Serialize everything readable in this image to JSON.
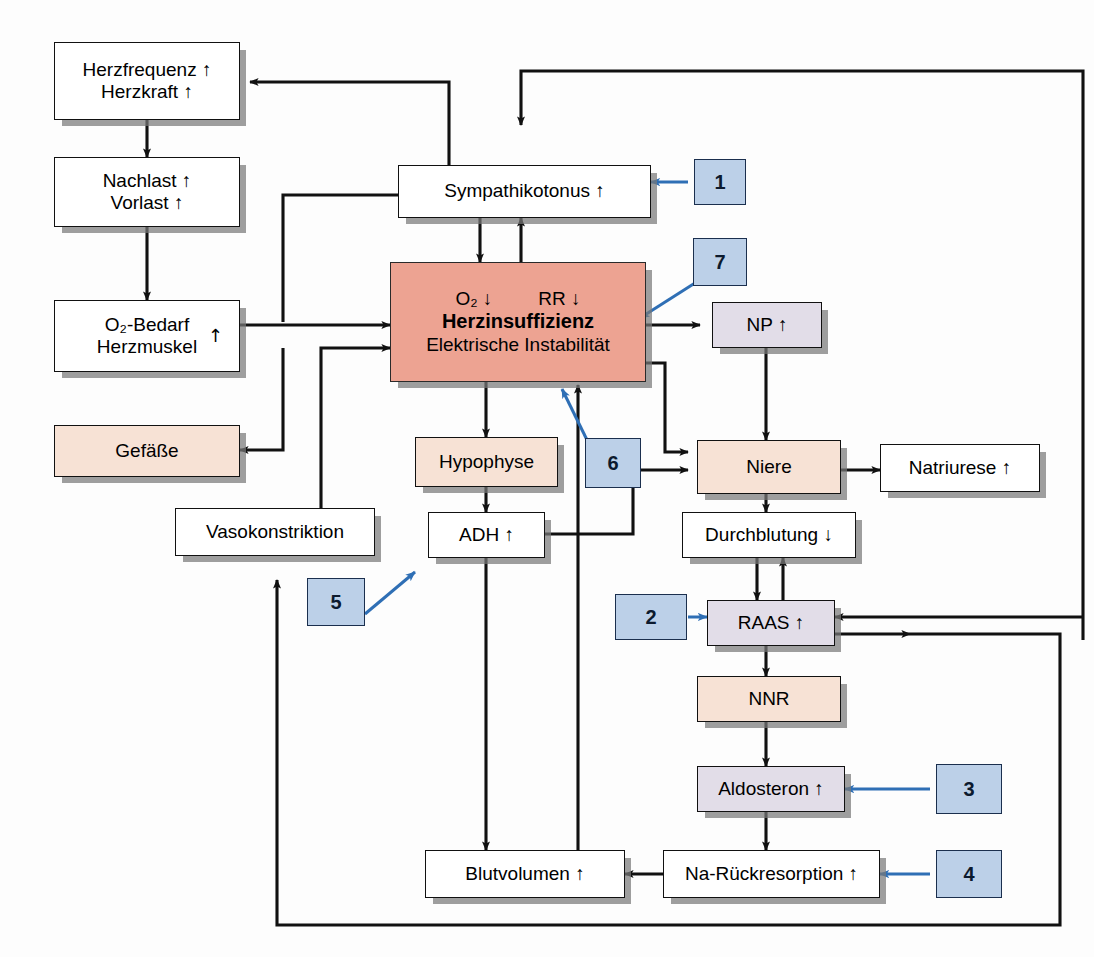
{
  "diagram": {
    "language": "de",
    "colors": {
      "center_fill": "#eda392",
      "peach_fill": "#f7e2d5",
      "lavender_fill": "#e2dde8",
      "white_fill": "#ffffff",
      "marker_fill": "#bcd0e8",
      "marker_border": "#1b2f4e",
      "marker_arrow": "#2f6fb5",
      "line": "#111111",
      "shadow": "#8b8b8b"
    },
    "glyphs": {
      "up": "↑",
      "down": "↓"
    }
  },
  "nodes": {
    "herzfrequenz": {
      "line1": "Herzfrequenz ↑",
      "line2": "Herzkraft ↑",
      "fill": "white"
    },
    "nachlast": {
      "line1": "Nachlast ↑",
      "line2": "Vorlast ↑",
      "fill": "white"
    },
    "o2bedarf": {
      "line1": "O₂-Bedarf",
      "line2": "Herzmuskel",
      "arrow": "↑",
      "fill": "white"
    },
    "gefaesse": {
      "line1": "Gefäße",
      "fill": "peach"
    },
    "vasokonstriktion": {
      "line1": "Vasokonstriktion",
      "fill": "white"
    },
    "sympathikotonus": {
      "line1": "Sympathikotonus ↑",
      "fill": "white"
    },
    "herzinsuffizienz": {
      "o2": "O₂ ↓",
      "rr": "RR ↓",
      "title": "Herzinsuffizienz",
      "subtitle": "Elektrische Instabilität",
      "fill": "center"
    },
    "hypophyse": {
      "line1": "Hypophyse",
      "fill": "peach"
    },
    "adh": {
      "line1": "ADH ↑",
      "fill": "white"
    },
    "blutvolumen": {
      "line1": "Blutvolumen ↑",
      "fill": "white"
    },
    "np": {
      "line1": "NP ↑",
      "fill": "lavender"
    },
    "niere": {
      "line1": "Niere",
      "fill": "peach"
    },
    "natriurese": {
      "line1": "Natriurese ↑",
      "fill": "white"
    },
    "durchblutung": {
      "line1": "Durchblutung ↓",
      "fill": "white"
    },
    "raas": {
      "line1": "RAAS ↑",
      "fill": "lavender"
    },
    "nnr": {
      "line1": "NNR",
      "fill": "peach"
    },
    "aldosteron": {
      "line1": "Aldosteron ↑",
      "fill": "lavender"
    },
    "narueckresorption": {
      "line1": "Na-Rückresorption ↑",
      "fill": "white"
    }
  },
  "markers": [
    {
      "id": "m1",
      "label": "1",
      "target": "sympathikotonus"
    },
    {
      "id": "m2",
      "label": "2",
      "target": "raas"
    },
    {
      "id": "m3",
      "label": "3",
      "target": "aldosteron"
    },
    {
      "id": "m4",
      "label": "4",
      "target": "narueckresorption"
    },
    {
      "id": "m5",
      "label": "5",
      "target": "adh"
    },
    {
      "id": "m6",
      "label": "6",
      "target": "herzinsuffizienz"
    },
    {
      "id": "m7",
      "label": "7",
      "target": "herzinsuffizienz"
    }
  ]
}
